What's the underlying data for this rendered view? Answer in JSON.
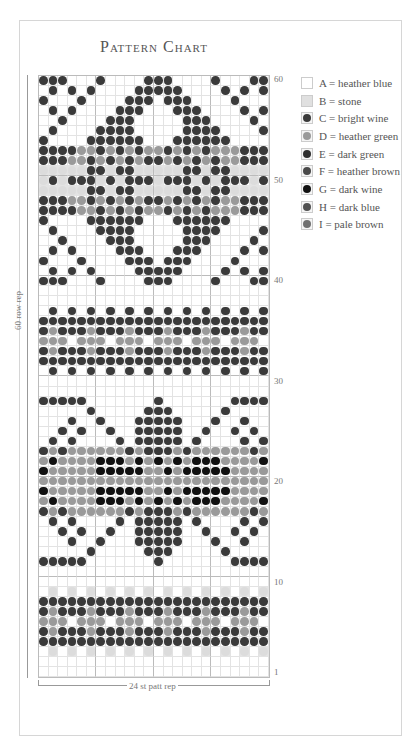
{
  "title": "Pattern Chart",
  "row_labels": [
    {
      "label": "60",
      "row": 60
    },
    {
      "label": "50",
      "row": 50
    },
    {
      "label": "40",
      "row": 40
    },
    {
      "label": "30",
      "row": 30
    },
    {
      "label": "20",
      "row": 20
    },
    {
      "label": "10",
      "row": 10
    },
    {
      "label": "1",
      "row": 1
    }
  ],
  "side_label": "60 row rep",
  "bottom_label": "24 st patt rep",
  "legend": [
    {
      "code": "A",
      "text": "A = heather blue",
      "color": "#ffffff"
    },
    {
      "code": "B",
      "text": "B = stone",
      "color": "#dcdcdc"
    },
    {
      "code": "C",
      "text": "C = bright  wine",
      "color": "#3a3a3a"
    },
    {
      "code": "D",
      "text": "D = heather green",
      "color": "#9a9a9a"
    },
    {
      "code": "E",
      "text": "E = dark green",
      "color": "#2e2e2e"
    },
    {
      "code": "F",
      "text": "F = heather brown",
      "color": "#4a4a4a"
    },
    {
      "code": "G",
      "text": "G = dark wine",
      "color": "#111111"
    },
    {
      "code": "H",
      "text": "H = dark blue",
      "color": "#505050"
    },
    {
      "code": "I",
      "text": "I  = pale brown",
      "color": "#707070"
    }
  ],
  "chart_data": {
    "type": "table",
    "title": "Pattern Chart",
    "columns": 24,
    "rows": 60,
    "legend": [
      "A = heather blue",
      "B = stone",
      "C = bright wine",
      "D = heather green",
      "E = dark green",
      "F = heather brown",
      "G = dark wine",
      "H = dark blue",
      "I = pale brown"
    ],
    "xlabel": "24 st patt rep",
    "ylabel": "60 row rep",
    "row_tick_labels": [
      "1",
      "10",
      "20",
      "30",
      "40",
      "50",
      "60"
    ],
    "grid": [
      "CCC...C....CCC....C...CC",
      ".C.C.C....CCCCC....C.C.C",
      "C...C....CCC.CCC....C...",
      ".C.C....CCC...CCC....C.C",
      "..C....CCC.....CCC....C.",
      ".C....CCCC.....CCCC....C",
      "C....CCCCCC...CCCCCC....",
      "CCCCDDCDCDCDDCDCDCDDDCCC",
      "CCCDDCDCDCDCCDCDCDCDDCCC",
      "BBBBBCCBCCBBBBBCCBCCBBBB",
      "BCBCCCBCBCCCBCCCBCBCCCBC",
      "BBBBBCCBCCBBBBBCCBCCBBBB",
      "CCCDDCDCDCDCCDCDCDCDDCCC",
      "CCCCDDCDCDCDDCDCDCDDDCCC",
      "C....CCCCCC...CCCCCC....",
      ".C....CCCC.....CCCC....C",
      "..C....CCC.....CCC....C.",
      ".C.C....CCC...CCC....C.C",
      "C...C....CCC.CCC....C...",
      ".C.C.C....CCCCC....C.C.C",
      "CCC...C....CCC....C...CC",
      "........................",
      "........................",
      ".C.C.C.C.C.C.C.C.C.C.C.C",
      "CCCCCCCCCCCCCCCCCCCCCCCC",
      "CDCCCDCCCDCCCDCCCDCCCDCC",
      "DDD.DDD.DDD.DDD.DDD.DDD.",
      "CDCCCDCCCDCCCDCCCDCCCDCC",
      "CCCCCCCCCCCCCCCCCCCCCCCC",
      ".C.C.C.C.C.C.C.C.C.C.C.C",
      "........................",
      "........................",
      "CCCCC.......C.......CCCC",
      ".....C.....CCC.....C....",
      "...C..C...CCCCC...C..C..",
      "..C.C..C..CCCCC..C..C.C.",
      ".C.C....C.CCCCC.C....C.C",
      "CDCDDDDDDCDCCCDCDDDDDDCD",
      "DGDDDDGGGDGDGDGDGGGDDDDG",
      "GDDDDDGGGGGDDGDGGGGGDDDD",
      "DDDDDDDDDDDDDDDDDDDDDDDD",
      "GDDDDDGGGGGDDGDGGGGGDDDD",
      "DGDDDDGGGDGDGDGDGGGDDDDG",
      "CDCDDDDDDCDCCCDCDDDDDDCD",
      ".C.C....C.CCCCC.C....C.C",
      "..C.C..C..CCCCC..C..C.C.",
      "...C..C...CCCCC...C..C..",
      ".....C.....CCC.....C....",
      "CCCCC.......C.......CCCC",
      "........................",
      "........................",
      ".B.B.B.B.B.B.B.B.B.B.B.B",
      "CCCCCCCCCCCCCCCCCCCCCCCC",
      "CDCCCDCCCDCCCDCCCDCCCDCC",
      "DDD.DDD.DDD.DDD.DDD.DDD.",
      "CDCCCDCCCDCCCDCCCDCCCDCC",
      "CCCCCCCCCCCCCCCCCCCCCCCC",
      ".B.B.B.B.B.B.B.B.B.B.B.B",
      "........................",
      "........................"
    ]
  }
}
